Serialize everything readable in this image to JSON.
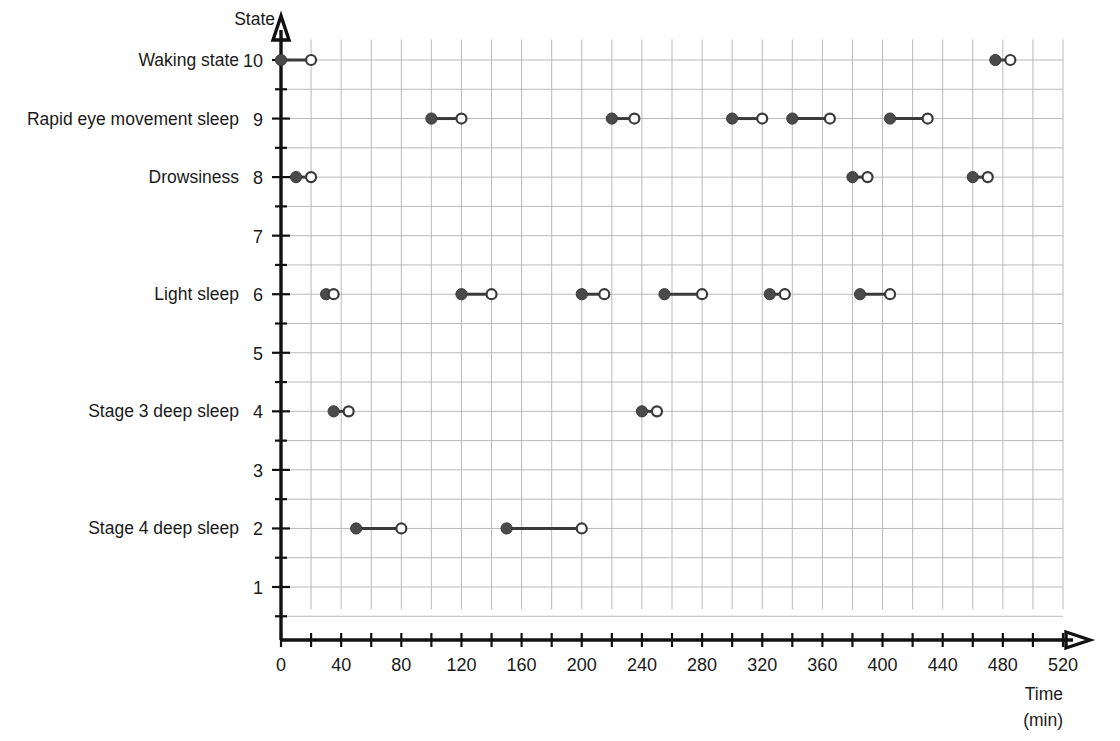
{
  "chart_data": {
    "type": "line",
    "title": "",
    "xlabel": "Time (min)",
    "ylabel": "State",
    "xlim": [
      0,
      520
    ],
    "ylim": [
      0,
      10
    ],
    "grid": true,
    "legend": "none",
    "x_tick_step_minor": 20,
    "x_tick_labels": [
      "0",
      "40",
      "80",
      "120",
      "160",
      "200",
      "240",
      "280",
      "320",
      "360",
      "400",
      "440",
      "480",
      "520"
    ],
    "x_tick_values": [
      0,
      40,
      80,
      120,
      160,
      200,
      240,
      280,
      320,
      360,
      400,
      440,
      480,
      520
    ],
    "y_tick_labels": [
      "1",
      "2",
      "3",
      "4",
      "5",
      "6",
      "7",
      "8",
      "9",
      "10"
    ],
    "y_tick_values": [
      1,
      2,
      3,
      4,
      5,
      6,
      7,
      8,
      9,
      10
    ],
    "y_state_labels": [
      {
        "value": 10,
        "label": "Waking state"
      },
      {
        "value": 9,
        "label": "Rapid eye movement sleep"
      },
      {
        "value": 8,
        "label": "Drowsiness"
      },
      {
        "value": 6,
        "label": "Light sleep"
      },
      {
        "value": 4,
        "label": "Stage 3 deep sleep"
      },
      {
        "value": 2,
        "label": "Stage 4 deep sleep"
      }
    ],
    "marker_start": "closed-circle",
    "marker_end": "open-circle",
    "series_name": "Sleep state over the night",
    "segments": [
      {
        "state": 10,
        "x_start": 0,
        "x_end": 20
      },
      {
        "state": 8,
        "x_start": 10,
        "x_end": 20
      },
      {
        "state": 6,
        "x_start": 30,
        "x_end": 35
      },
      {
        "state": 4,
        "x_start": 35,
        "x_end": 45
      },
      {
        "state": 2,
        "x_start": 50,
        "x_end": 80
      },
      {
        "state": 9,
        "x_start": 100,
        "x_end": 120
      },
      {
        "state": 6,
        "x_start": 120,
        "x_end": 140
      },
      {
        "state": 2,
        "x_start": 150,
        "x_end": 200
      },
      {
        "state": 6,
        "x_start": 200,
        "x_end": 215
      },
      {
        "state": 9,
        "x_start": 220,
        "x_end": 235
      },
      {
        "state": 4,
        "x_start": 240,
        "x_end": 250
      },
      {
        "state": 6,
        "x_start": 255,
        "x_end": 280
      },
      {
        "state": 9,
        "x_start": 300,
        "x_end": 320
      },
      {
        "state": 6,
        "x_start": 325,
        "x_end": 335
      },
      {
        "state": 9,
        "x_start": 340,
        "x_end": 365
      },
      {
        "state": 8,
        "x_start": 380,
        "x_end": 390
      },
      {
        "state": 6,
        "x_start": 385,
        "x_end": 405
      },
      {
        "state": 9,
        "x_start": 405,
        "x_end": 430
      },
      {
        "state": 8,
        "x_start": 460,
        "x_end": 470
      },
      {
        "state": 10,
        "x_start": 475,
        "x_end": 485
      }
    ],
    "colors": {
      "line": "#3a3a3a",
      "marker_fill": "#4a4a4a",
      "marker_open_fill": "#ffffff",
      "grid": "#b9b9b9",
      "axis": "#111111",
      "text": "#1a1a1a",
      "background": "#ffffff"
    }
  }
}
